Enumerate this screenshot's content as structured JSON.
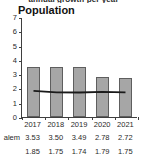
{
  "top_fragment": "annual growth per year",
  "chart_data": {
    "type": "bar",
    "title": "Population",
    "xlabel": "",
    "ylabel": "",
    "ylim": [
      0,
      7
    ],
    "yticks": [
      7,
      6,
      5,
      4,
      3,
      2,
      1,
      0
    ],
    "categories": [
      "2017",
      "2018",
      "2019",
      "2020",
      "2021"
    ],
    "grid": false,
    "legend": "none",
    "series": [
      {
        "name": "alem",
        "type": "bar",
        "color": "#a6a6a6",
        "values": [
          3.53,
          3.5,
          3.49,
          2.78,
          2.72
        ]
      },
      {
        "name": "",
        "type": "line",
        "color": "#1a1a1a",
        "values": [
          1.85,
          1.75,
          1.74,
          1.79,
          1.75
        ]
      }
    ]
  },
  "table": {
    "row1_label": "alem",
    "row1_values": [
      "3.53",
      "3.50",
      "3.49",
      "2.78",
      "2.72"
    ],
    "row2_label": "",
    "row2_values": [
      "1.85",
      "1.75",
      "1.74",
      "1.79",
      "1.75"
    ]
  }
}
